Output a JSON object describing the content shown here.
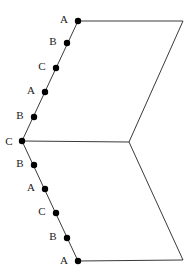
{
  "figure": {
    "type": "geometric-diagram",
    "background_color": "#ffffff",
    "stroke_color": "#3a3a3a",
    "stroke_width": 1,
    "dot_color": "#000000",
    "dot_radius": 3.2,
    "label_color": "#1a1a1a",
    "label_font_size": 11,
    "canvas": {
      "width": 195,
      "height": 280
    },
    "vertices": [
      {
        "name": "top-left-vertex",
        "x": 78,
        "y": 21
      },
      {
        "name": "top-right-vertex",
        "x": 183,
        "y": 21
      },
      {
        "name": "middle-right-vertex",
        "x": 129,
        "y": 142
      },
      {
        "name": "bottom-right-vertex",
        "x": 183,
        "y": 260
      },
      {
        "name": "bottom-left-vertex",
        "x": 78,
        "y": 261
      },
      {
        "name": "middle-left-vertex",
        "x": 22,
        "y": 141
      }
    ],
    "outline_path": "M 78 21 L 183 21 L 129 142 L 183 260 L 78 261 L 22 141 Z",
    "interior_segment": {
      "name": "middle-horizontal",
      "x1": 22,
      "y1": 141,
      "x2": 129,
      "y2": 142
    },
    "edges": [
      {
        "name": "top-edge",
        "from": "top-left-vertex",
        "to": "top-right-vertex"
      },
      {
        "name": "upper-right-edge",
        "from": "top-right-vertex",
        "to": "middle-right-vertex"
      },
      {
        "name": "lower-right-edge",
        "from": "middle-right-vertex",
        "to": "bottom-right-vertex"
      },
      {
        "name": "bottom-edge",
        "from": "bottom-right-vertex",
        "to": "bottom-left-vertex"
      },
      {
        "name": "lower-left-edge",
        "from": "bottom-left-vertex",
        "to": "middle-left-vertex"
      },
      {
        "name": "upper-left-edge",
        "from": "middle-left-vertex",
        "to": "top-left-vertex"
      }
    ],
    "points": [
      {
        "id": "p1",
        "label": "A",
        "x": 78,
        "y": 21,
        "label_x": 64,
        "label_y": 19,
        "edge": "upper-left-edge"
      },
      {
        "id": "p2",
        "label": "B",
        "x": 67,
        "y": 43,
        "label_x": 53,
        "label_y": 41,
        "edge": "upper-left-edge"
      },
      {
        "id": "p3",
        "label": "C",
        "x": 56,
        "y": 68,
        "label_x": 42,
        "label_y": 66,
        "edge": "upper-left-edge"
      },
      {
        "id": "p4",
        "label": "A",
        "x": 45,
        "y": 92,
        "label_x": 31,
        "label_y": 90,
        "edge": "upper-left-edge"
      },
      {
        "id": "p5",
        "label": "B",
        "x": 34,
        "y": 117,
        "label_x": 20,
        "label_y": 115,
        "edge": "upper-left-edge"
      },
      {
        "id": "p6",
        "label": "C",
        "x": 22,
        "y": 141,
        "label_x": 9,
        "label_y": 141,
        "edge": "middle-left-vertex"
      },
      {
        "id": "p7",
        "label": "B",
        "x": 34,
        "y": 165,
        "label_x": 20,
        "label_y": 163,
        "edge": "lower-left-edge"
      },
      {
        "id": "p8",
        "label": "A",
        "x": 45,
        "y": 189,
        "label_x": 31,
        "label_y": 187,
        "edge": "lower-left-edge"
      },
      {
        "id": "p9",
        "label": "C",
        "x": 56,
        "y": 213,
        "label_x": 42,
        "label_y": 211,
        "edge": "lower-left-edge"
      },
      {
        "id": "p10",
        "label": "B",
        "x": 67,
        "y": 238,
        "label_x": 53,
        "label_y": 236,
        "edge": "lower-left-edge"
      },
      {
        "id": "p11",
        "label": "A",
        "x": 78,
        "y": 261,
        "label_x": 64,
        "label_y": 260,
        "edge": "lower-left-edge"
      }
    ]
  }
}
